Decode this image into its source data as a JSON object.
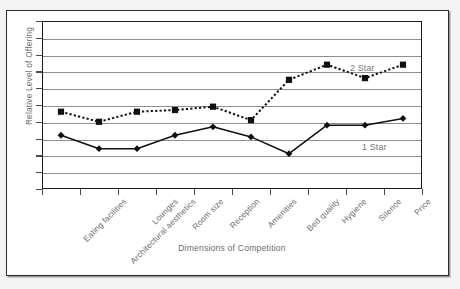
{
  "figure": {
    "kind": "line-chart-figure",
    "background_color": "#f3f3f2",
    "frame_color": "#2b2b2b"
  },
  "chart_data": {
    "type": "line",
    "title": "",
    "subtitle": "",
    "xlabel": "Dimensions of Competition",
    "ylabel": "Relative Level of Offering",
    "grid": true,
    "gridlines": 10,
    "legend_position": "inline-right",
    "xlim": [
      0,
      10
    ],
    "ylim": [
      0,
      10
    ],
    "categories": [
      "Eating facilities",
      "Architectural aesthetics",
      "Lounges",
      "Room size",
      "Reception",
      "Amenities",
      "Bed quality",
      "Hygiene",
      "Silence",
      "Price"
    ],
    "series": [
      {
        "name": "2 Star",
        "style": "dotted",
        "marker": "square",
        "color": "#111111",
        "values": [
          4.6,
          4.0,
          4.6,
          4.7,
          4.9,
          4.1,
          6.5,
          7.4,
          6.6,
          7.4
        ]
      },
      {
        "name": "1 Star",
        "style": "solid",
        "marker": "diamond",
        "color": "#111111",
        "values": [
          3.2,
          2.4,
          2.4,
          3.2,
          3.7,
          3.1,
          2.1,
          3.8,
          3.8,
          4.2
        ]
      }
    ],
    "annotations": [
      {
        "text": "2 Star",
        "series": "2 Star"
      },
      {
        "text": "1 Star",
        "series": "1 Star"
      }
    ]
  },
  "axis": {
    "x_title": "Dimensions of Competition",
    "y_title": "Relative Level of Offering"
  },
  "labels": {
    "two_star": "2 Star",
    "one_star": "1 Star"
  }
}
